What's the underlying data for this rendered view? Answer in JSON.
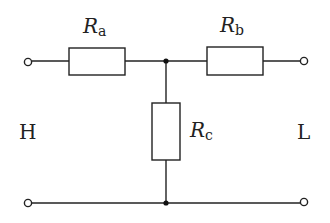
{
  "diagram": {
    "type": "T-network resistor circuit",
    "colors": {
      "line": "#222222",
      "background": "#ffffff"
    },
    "resistors": [
      {
        "id": "Ra",
        "symbol": "R",
        "subscript": "a",
        "orientation": "horizontal",
        "position": "top-left series"
      },
      {
        "id": "Rb",
        "symbol": "R",
        "subscript": "b",
        "orientation": "horizontal",
        "position": "top-right series"
      },
      {
        "id": "Rc",
        "symbol": "R",
        "subscript": "c",
        "orientation": "vertical",
        "position": "shunt"
      }
    ],
    "ports": {
      "left": "H",
      "right": "L"
    },
    "terminals": 4,
    "junctions": 2
  }
}
